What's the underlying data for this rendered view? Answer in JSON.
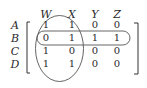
{
  "matrix": {
    "column_labels": [
      "W",
      "X",
      "Y",
      "Z"
    ],
    "row_labels": [
      "A",
      "B",
      "C",
      "D"
    ],
    "values": [
      [
        "1",
        "1",
        "0",
        "0"
      ],
      [
        "0",
        "1",
        "1",
        "1"
      ],
      [
        "1",
        "0",
        "0",
        "0"
      ],
      [
        "1",
        "1",
        "0",
        "0"
      ]
    ]
  },
  "highlights": {
    "columns_group": [
      "W",
      "X"
    ],
    "row_group": [
      "B"
    ]
  },
  "colors": {
    "ink": "#2a2a2a",
    "outline": "#555555"
  }
}
